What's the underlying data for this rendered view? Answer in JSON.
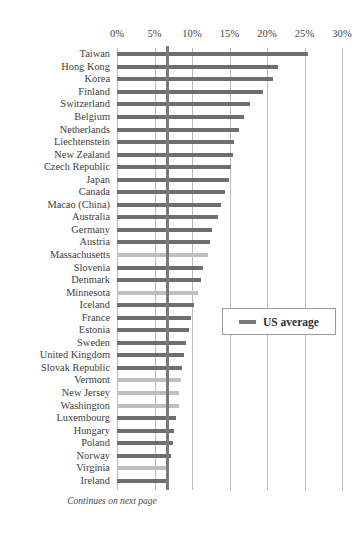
{
  "chart_data": {
    "type": "bar",
    "orientation": "horizontal",
    "title": "",
    "xlabel": "",
    "ylabel": "",
    "xlim": [
      0,
      30
    ],
    "grid": true,
    "xtick_labels": [
      "0%",
      "5%",
      "10%",
      "15%",
      "20%",
      "25%",
      "30%"
    ],
    "xticks": [
      0,
      5,
      10,
      15,
      20,
      25,
      30
    ],
    "legend": {
      "position": "middle-right",
      "entries": [
        {
          "label": "US average",
          "color": "#7a7a7a",
          "value": 6.7
        }
      ]
    },
    "reference_line": {
      "label": "US average",
      "value": 6.7,
      "color": "#7a7a7a"
    },
    "series_colors": {
      "country": "#6e6e6e",
      "us_state": "#bfbfbf"
    },
    "footnote": "Continues on next page",
    "categories": [
      "Taiwan",
      "Hong Kong",
      "Korea",
      "Finland",
      "Switzerland",
      "Belgium",
      "Netherlands",
      "Liechtenstein",
      "New Zealand",
      "Czech Republic",
      "Japan",
      "Canada",
      "Macao (China)",
      "Australia",
      "Germany",
      "Austria",
      "Massachusetts",
      "Slovenia",
      "Denmark",
      "Minnesota",
      "Iceland",
      "France",
      "Estonia",
      "Sweden",
      "United Kingdom",
      "Slovak Republic",
      "Vermont",
      "New Jersey",
      "Washington",
      "Luxembourg",
      "Hungary",
      "Poland",
      "Norway",
      "Virginia",
      "Ireland"
    ],
    "values": [
      25.4,
      21.5,
      20.8,
      19.4,
      17.7,
      16.9,
      16.2,
      15.6,
      15.4,
      15.2,
      14.9,
      14.4,
      13.9,
      13.4,
      12.6,
      12.4,
      12.1,
      11.4,
      11.2,
      10.8,
      10.2,
      9.9,
      9.6,
      9.2,
      8.9,
      8.7,
      8.5,
      8.3,
      8.2,
      7.8,
      7.6,
      7.4,
      7.2,
      6.9,
      6.6
    ],
    "bars": [
      {
        "label": "Taiwan",
        "value": 25.4,
        "kind": "country"
      },
      {
        "label": "Hong Kong",
        "value": 21.5,
        "kind": "country"
      },
      {
        "label": "Korea",
        "value": 20.8,
        "kind": "country"
      },
      {
        "label": "Finland",
        "value": 19.4,
        "kind": "country"
      },
      {
        "label": "Switzerland",
        "value": 17.7,
        "kind": "country"
      },
      {
        "label": "Belgium",
        "value": 16.9,
        "kind": "country"
      },
      {
        "label": "Netherlands",
        "value": 16.2,
        "kind": "country"
      },
      {
        "label": "Liechtenstein",
        "value": 15.6,
        "kind": "country"
      },
      {
        "label": "New Zealand",
        "value": 15.4,
        "kind": "country"
      },
      {
        "label": "Czech Republic",
        "value": 15.2,
        "kind": "country"
      },
      {
        "label": "Japan",
        "value": 14.9,
        "kind": "country"
      },
      {
        "label": "Canada",
        "value": 14.4,
        "kind": "country"
      },
      {
        "label": "Macao (China)",
        "value": 13.9,
        "kind": "country"
      },
      {
        "label": "Australia",
        "value": 13.4,
        "kind": "country"
      },
      {
        "label": "Germany",
        "value": 12.6,
        "kind": "country"
      },
      {
        "label": "Austria",
        "value": 12.4,
        "kind": "country"
      },
      {
        "label": "Massachusetts",
        "value": 12.1,
        "kind": "us_state"
      },
      {
        "label": "Slovenia",
        "value": 11.4,
        "kind": "country"
      },
      {
        "label": "Denmark",
        "value": 11.2,
        "kind": "country"
      },
      {
        "label": "Minnesota",
        "value": 10.8,
        "kind": "us_state"
      },
      {
        "label": "Iceland",
        "value": 10.2,
        "kind": "country"
      },
      {
        "label": "France",
        "value": 9.9,
        "kind": "country"
      },
      {
        "label": "Estonia",
        "value": 9.6,
        "kind": "country"
      },
      {
        "label": "Sweden",
        "value": 9.2,
        "kind": "country"
      },
      {
        "label": "United Kingdom",
        "value": 8.9,
        "kind": "country"
      },
      {
        "label": "Slovak Republic",
        "value": 8.7,
        "kind": "country"
      },
      {
        "label": "Vermont",
        "value": 8.5,
        "kind": "us_state"
      },
      {
        "label": "New Jersey",
        "value": 8.3,
        "kind": "us_state"
      },
      {
        "label": "Washington",
        "value": 8.2,
        "kind": "us_state"
      },
      {
        "label": "Luxembourg",
        "value": 7.8,
        "kind": "country"
      },
      {
        "label": "Hungary",
        "value": 7.6,
        "kind": "country"
      },
      {
        "label": "Poland",
        "value": 7.4,
        "kind": "country"
      },
      {
        "label": "Norway",
        "value": 7.2,
        "kind": "country"
      },
      {
        "label": "Virginia",
        "value": 6.9,
        "kind": "us_state"
      },
      {
        "label": "Ireland",
        "value": 6.6,
        "kind": "country"
      }
    ]
  }
}
